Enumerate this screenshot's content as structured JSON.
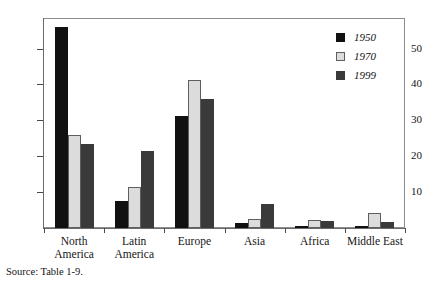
{
  "chart_data": {
    "type": "bar",
    "title": "",
    "subtitle": "",
    "xlabel": "",
    "ylabel": "",
    "categories": [
      "North America",
      "Latin America",
      "Europe",
      "Asia",
      "Africa",
      "Middle East"
    ],
    "series": [
      {
        "name": "1950",
        "color": "#111111",
        "values": [
          56.0,
          7.5,
          31.2,
          1.5,
          0.6,
          0.3
        ]
      },
      {
        "name": "1970",
        "color": "#dcdcdc",
        "values": [
          26.0,
          11.3,
          41.3,
          2.6,
          2.2,
          4.3
        ]
      },
      {
        "name": "1999",
        "color": "#3a3a3a",
        "values": [
          23.5,
          21.5,
          36.0,
          6.8,
          2.0,
          1.6
        ]
      }
    ],
    "ylim": [
      0,
      58.5
    ],
    "yticks": [
      10,
      20,
      30,
      40,
      50
    ],
    "ytick_labels": [
      "10",
      "20",
      "30",
      "40",
      "50"
    ],
    "grid": false,
    "legend_position": "top-right",
    "legend_entries": [
      "1950",
      "1970",
      "1999"
    ],
    "annotations": [
      "Source: Table 1-9."
    ]
  },
  "axis": {
    "y_labels": [
      "50",
      "40",
      "30",
      "20",
      "10"
    ]
  },
  "categories": [
    {
      "line1": "North",
      "line2": "America"
    },
    {
      "line1": "Latin",
      "line2": "America"
    },
    {
      "line1": "Europe",
      "line2": ""
    },
    {
      "line1": "Asia",
      "line2": ""
    },
    {
      "line1": "Africa",
      "line2": ""
    },
    {
      "line1": "Middle East",
      "line2": ""
    }
  ],
  "legend": {
    "items": [
      {
        "label": "1950",
        "color": "#111111"
      },
      {
        "label": "1970",
        "color": "#dcdcdc"
      },
      {
        "label": "1999",
        "color": "#3a3a3a"
      }
    ]
  },
  "source": {
    "text": "Source: Table 1-9."
  }
}
